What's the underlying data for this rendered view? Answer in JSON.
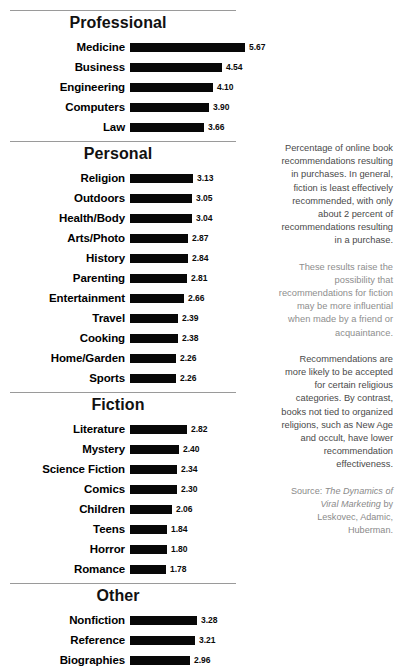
{
  "chart_data": {
    "type": "bar",
    "title": "Percentage of online book recommendations resulting in purchases",
    "xlabel": "",
    "ylabel": "",
    "orientation": "horizontal",
    "xlim": [
      0,
      5.67
    ],
    "grid": false,
    "legend": null,
    "value_format": "2 decimal places",
    "sections": [
      {
        "title": "Professional",
        "categories": [
          "Medicine",
          "Business",
          "Engineering",
          "Computers",
          "Law"
        ],
        "values": [
          5.67,
          4.54,
          4.1,
          3.9,
          3.66
        ],
        "labels": [
          "5.67",
          "4.54",
          "4.10",
          "3.90",
          "3.66"
        ]
      },
      {
        "title": "Personal",
        "categories": [
          "Religion",
          "Outdoors",
          "Health/Body",
          "Arts/Photo",
          "History",
          "Parenting",
          "Entertainment",
          "Travel",
          "Cooking",
          "Home/Garden",
          "Sports"
        ],
        "values": [
          3.13,
          3.05,
          3.04,
          2.87,
          2.84,
          2.81,
          2.66,
          2.39,
          2.38,
          2.26,
          2.26
        ],
        "labels": [
          "3.13",
          "3.05",
          "3.04",
          "2.87",
          "2.84",
          "2.81",
          "2.66",
          "2.39",
          "2.38",
          "2.26",
          "2.26"
        ]
      },
      {
        "title": "Fiction",
        "categories": [
          "Literature",
          "Mystery",
          "Science Fiction",
          "Comics",
          "Children",
          "Teens",
          "Horror",
          "Romance"
        ],
        "values": [
          2.82,
          2.4,
          2.34,
          2.3,
          2.06,
          1.84,
          1.8,
          1.78
        ],
        "labels": [
          "2.82",
          "2.40",
          "2.34",
          "2.30",
          "2.06",
          "1.84",
          "1.80",
          "1.78"
        ]
      },
      {
        "title": "Other",
        "categories": [
          "Nonfiction",
          "Reference",
          "Biographies"
        ],
        "values": [
          3.28,
          3.21,
          2.96
        ],
        "labels": [
          "3.28",
          "3.21",
          "2.96"
        ]
      }
    ]
  },
  "caption": {
    "paragraphs": [
      "Percentage of online book recommendations resulting in purchases. In general, fiction is least effectively recommended, with only about 2 percent of recommendations resulting in a purchase.",
      "These results raise the possibility that recommendations for fiction may be more influential when made by a friend or acquaintance.",
      "Recommendations are more likely to be accepted for certain religious categories. By contrast, books not tied to organized religions, such as New Age and occult, have lower recommendation effectiveness."
    ],
    "source_prefix": "Source: ",
    "source_title": "The Dynamics of Viral Marketing",
    "source_suffix": " by Leskovec, Adamic, Huberman."
  },
  "colors": {
    "bar": "#080808",
    "rule": "#9a9a9a",
    "caption_text": "#5c5c5c",
    "background": "#ffffff"
  }
}
